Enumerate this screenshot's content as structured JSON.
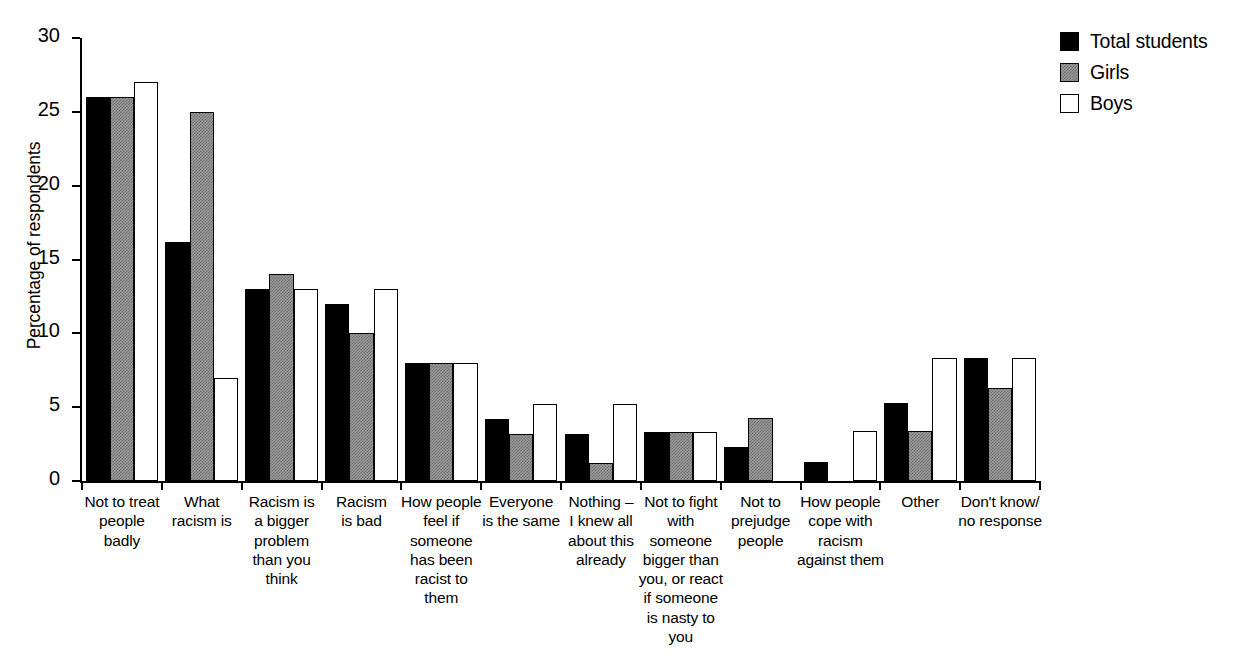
{
  "chart_data": {
    "type": "bar",
    "title": "",
    "xlabel": "",
    "ylabel": "Percentage of respondents",
    "ylim": [
      0,
      30
    ],
    "yticks": [
      0,
      5,
      10,
      15,
      20,
      25,
      30
    ],
    "grid": false,
    "legend_position": "top-right",
    "categories": [
      "Not to treat people badly",
      "What racism is",
      "Racism is a bigger problem than you think",
      "Racism is bad",
      "How people feel if someone has been racist to them",
      "Everyone is the same",
      "Nothing – I knew all about this already",
      "Not to fight with someone bigger than you, or react if someone is nasty to you",
      "Not to prejudge people",
      "How people cope with racism against them",
      "Other",
      "Don't know/ no response"
    ],
    "category_lines": [
      [
        "Not to treat",
        "people",
        "badly"
      ],
      [
        "What",
        "racism is"
      ],
      [
        "Racism is",
        "a bigger",
        "problem",
        "than you",
        "think"
      ],
      [
        "Racism",
        "is bad"
      ],
      [
        "How people",
        "feel if",
        "someone",
        "has been",
        "racist to",
        "them"
      ],
      [
        "Everyone",
        "is the same"
      ],
      [
        "Nothing –",
        "I knew all",
        "about this",
        "already"
      ],
      [
        "Not to fight",
        "with",
        "someone",
        "bigger than",
        "you, or react",
        "if someone",
        "is nasty to",
        "you"
      ],
      [
        "Not to",
        "prejudge",
        "people"
      ],
      [
        "How people",
        "cope with",
        "racism",
        "against them"
      ],
      [
        "Other"
      ],
      [
        "Don't know/",
        "no response"
      ]
    ],
    "series": [
      {
        "name": "Total students",
        "color": "#000000",
        "style": "solid-black",
        "values": [
          26,
          16.2,
          13,
          12,
          8,
          4.2,
          3.2,
          3.3,
          2.3,
          1.3,
          5.3,
          8.3
        ]
      },
      {
        "name": "Girls",
        "color": "#9a9a9a",
        "style": "gray-hatched",
        "values": [
          26,
          25,
          14,
          10,
          8,
          3.2,
          1.2,
          3.3,
          4.3,
          0,
          3.4,
          6.3
        ]
      },
      {
        "name": "Boys",
        "color": "#ffffff",
        "style": "white-outline",
        "values": [
          27,
          7,
          13,
          13,
          8,
          5.2,
          5.2,
          3.3,
          0,
          3.4,
          8.3,
          8.3
        ]
      }
    ]
  },
  "legend": {
    "items": [
      {
        "label": "Total students",
        "swatch": "total"
      },
      {
        "label": "Girls",
        "swatch": "girls"
      },
      {
        "label": "Boys",
        "swatch": "boys"
      }
    ]
  }
}
